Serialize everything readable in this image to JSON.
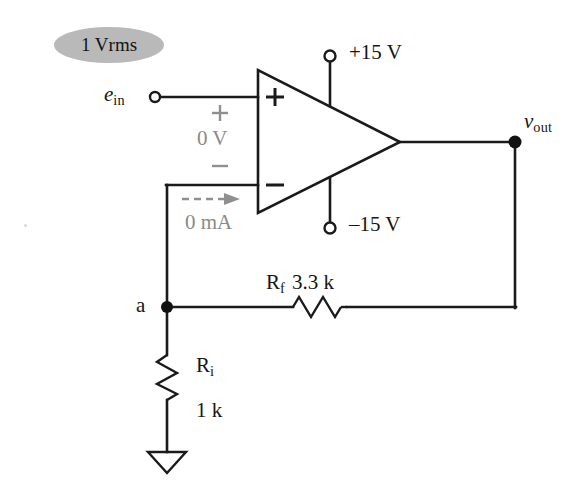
{
  "figure": {
    "type": "circuit-schematic",
    "background_color": "#ffffff",
    "wire_color": "#1a1a1a",
    "annotation_color": "#8a8a8a",
    "badge_fill": "#b9b9b9"
  },
  "source_badge": {
    "value": "1 V",
    "subscript": "rms"
  },
  "input": {
    "symbol": "e",
    "subscript": "in",
    "terminal": "open-circle-terminal"
  },
  "opamp": {
    "noninverting_pin_label": "+",
    "inverting_pin_label": "–",
    "differential": {
      "plus": "+",
      "voltage": "0 V",
      "minus": "–"
    },
    "supply_positive": {
      "label": "+15 V",
      "terminal": "open-circle-terminal"
    },
    "supply_negative": {
      "label": "–15 V",
      "terminal": "open-circle-terminal"
    }
  },
  "current_annotation": {
    "label": "0 mA",
    "arrow": "dashed-right-arrow"
  },
  "output": {
    "symbol": "v",
    "subscript": "out",
    "node": "junction-dot"
  },
  "node_a": {
    "label": "a",
    "marker": "junction-dot"
  },
  "feedback_resistor": {
    "symbol": "R",
    "subscript": "f",
    "value": "3.3 k",
    "combined_label": "R_f 3.3 k"
  },
  "input_resistor": {
    "symbol": "R",
    "subscript": "i",
    "value": "1 k",
    "combined_label": "R_i 1 k"
  },
  "ground": {
    "symbol": "ground-triangle"
  }
}
